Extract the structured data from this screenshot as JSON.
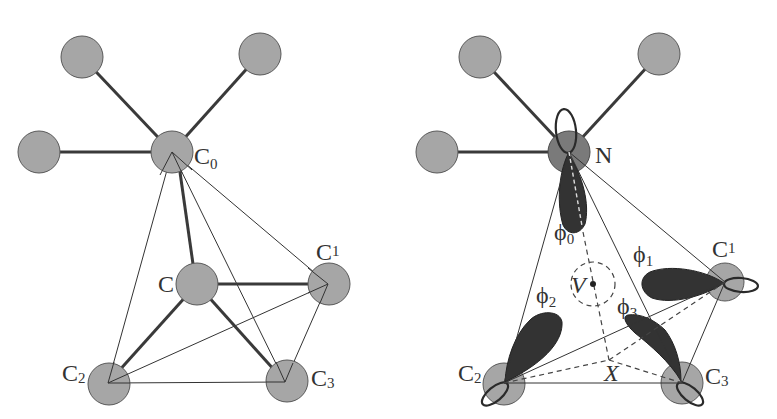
{
  "figure": {
    "left_panel": {
      "atom_labels": {
        "c0": {
          "base": "C",
          "sub": "0"
        },
        "c": {
          "base": "C",
          "sub": ""
        },
        "c1": {
          "base": "C",
          "sub": "1"
        },
        "c2": {
          "base": "C",
          "sub": "2"
        },
        "c3": {
          "base": "C",
          "sub": "3"
        }
      }
    },
    "right_panel": {
      "atom_labels": {
        "n": {
          "base": "N",
          "sub": ""
        },
        "c1": {
          "base": "C",
          "sub": "1"
        },
        "c2": {
          "base": "C",
          "sub": "2"
        },
        "c3": {
          "base": "C",
          "sub": "3"
        }
      },
      "orbital_labels": {
        "phi0": {
          "base": "ϕ",
          "sub": "0"
        },
        "phi1": {
          "base": "ϕ",
          "sub": "1"
        },
        "phi2": {
          "base": "ϕ",
          "sub": "2"
        },
        "phi3": {
          "base": "ϕ",
          "sub": "3"
        }
      },
      "points": {
        "v": "V",
        "x": "X"
      }
    },
    "colors": {
      "atom_fill": "#a6a6a6",
      "nitrogen_fill": "#7a7a7a",
      "lobe_fill": "#333333",
      "line": "#333333"
    }
  }
}
